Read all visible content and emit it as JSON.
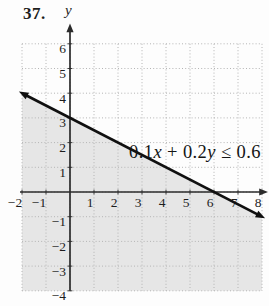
{
  "figure": {
    "problem_number": "37.",
    "equation": {
      "coef1": "0.1",
      "var1": "x",
      "op": " + 0.2",
      "var2": "y",
      "rhs": " ≤ 0.6"
    },
    "equation_full": "0.1x + 0.2y ≤ 0.6"
  },
  "chart_data": {
    "type": "line",
    "subtype": "linear-inequality-graph",
    "inequality": "0.1x + 0.2y ≤ 0.6",
    "axis_labels": {
      "y": "y"
    },
    "x_range": [
      -2,
      8
    ],
    "y_range": [
      -4,
      6
    ],
    "x_ticks": [
      -2,
      -1,
      1,
      2,
      3,
      4,
      5,
      6,
      7,
      8
    ],
    "y_ticks": [
      -4,
      -3,
      -2,
      -1,
      1,
      2,
      3,
      4,
      5,
      6
    ],
    "grid": "dotted",
    "series": [
      {
        "name": "boundary line",
        "points": [
          [
            -2,
            4
          ],
          [
            8,
            -1
          ]
        ],
        "style": "solid",
        "arrows": "both"
      }
    ],
    "x_intercept": [
      6,
      0
    ],
    "y_intercept": [
      0,
      3
    ],
    "slope": -0.5,
    "shaded_region": "below",
    "colors": {
      "shade": "#e6e6e6",
      "grid": "#b4b4b4",
      "axis": "#2b2b2b",
      "line": "#101010",
      "text": "#1d1d1d",
      "background": "#fdfdfd"
    }
  }
}
